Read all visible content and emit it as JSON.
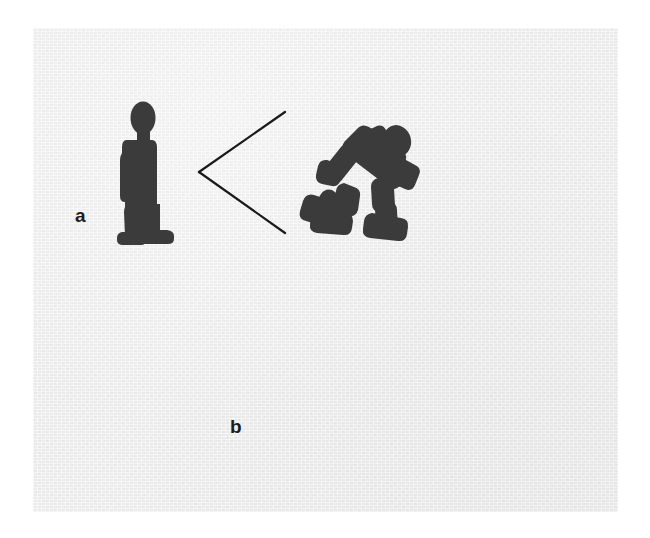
{
  "figure": {
    "background_color": "#ececec",
    "page_color": "#ffffff",
    "figure_color": "#3b3b3b",
    "line_color": "#1a1a1a",
    "plate": {
      "x": 33,
      "y": 28,
      "width": 585,
      "height": 484
    }
  },
  "panels": [
    {
      "id": "a",
      "label": "a",
      "label_position": {
        "x": 75,
        "y": 206
      },
      "observer": {
        "name": "standing-person",
        "pose": "standing",
        "facing": "right",
        "position": {
          "x": 118,
          "y": 100
        },
        "size": {
          "width": 64,
          "height": 134
        }
      },
      "target": {
        "name": "running-person",
        "pose": "running",
        "facing": "right",
        "position": {
          "x": 308,
          "y": 116
        },
        "size": {
          "width": 122,
          "height": 112
        }
      },
      "angle_marker": {
        "name": "wide-angle-lines",
        "vertex": {
          "x": 199,
          "y": 172
        },
        "upper_end": {
          "x": 285,
          "y": 112
        },
        "lower_end": {
          "x": 285,
          "y": 233
        },
        "aperture": "wide"
      }
    },
    {
      "id": "b",
      "label": "b",
      "label_position": {
        "x": 230,
        "y": 417
      },
      "observer": {
        "name": "standing-person",
        "pose": "standing",
        "facing": "right",
        "position": {
          "x": 281,
          "y": 328
        },
        "size": {
          "width": 64,
          "height": 134
        }
      },
      "target": {
        "name": "walking-person",
        "pose": "walking",
        "facing": "left",
        "position": {
          "x": 486,
          "y": 330
        },
        "size": {
          "width": 90,
          "height": 132
        }
      },
      "angle_marker": {
        "name": "narrow-angle-lines",
        "vertex": {
          "x": 353,
          "y": 386
        },
        "upper_end": {
          "x": 470,
          "y": 353
        },
        "lower_end": {
          "x": 470,
          "y": 414
        },
        "aperture": "narrow"
      }
    }
  ]
}
